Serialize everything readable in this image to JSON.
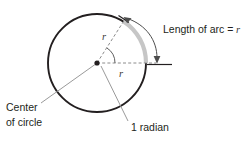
{
  "figure": {
    "labels": {
      "arc_length": "Length of arc =",
      "arc_length_var": "r",
      "center_line1": "Center",
      "center_line2": "of circle",
      "angle": "1 radian",
      "radius_upper": "r",
      "radius_lower": "r"
    },
    "colors": {
      "circle_stroke": "#231f20",
      "arc_highlight": "#c6c6c6",
      "radius_dashed": "#8c8c8c",
      "leader_line": "#9a9a9a",
      "text": "#231f20",
      "background": "#ffffff"
    },
    "geometry": {
      "center_x": 97,
      "center_y": 63,
      "radius": 49,
      "angle_degrees": 57.3,
      "arc_start_degrees": 0,
      "arc_end_degrees": 57.3
    }
  }
}
